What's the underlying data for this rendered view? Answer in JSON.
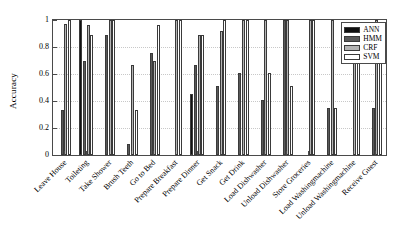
{
  "chart_data": {
    "type": "bar",
    "title": "",
    "xlabel": "",
    "ylabel": "Accuracy",
    "ylim": [
      0,
      1
    ],
    "yticks": [
      "0",
      "0.2",
      "0.4",
      "0.6",
      "0.8",
      "1"
    ],
    "ytick_values": [
      0,
      0.2,
      0.4,
      0.6,
      0.8,
      1
    ],
    "grid": true,
    "legend_position": "top-right",
    "categories": [
      "Leave House",
      "Toileting",
      "Take Shower",
      "Brush Teeth",
      "Go to Bed",
      "Prepare Breakfast",
      "Prepare Dinner",
      "Get Snack",
      "Get Drink",
      "Load Dishwasher",
      "Unload Dishwasher",
      "Store Groceries",
      "Load Washingmachine",
      "Unload Washingmachine",
      "Receive Guest"
    ],
    "series": [
      {
        "name": "ANN",
        "color": "#101010",
        "values": [
          0,
          1.0,
          0,
          0,
          0,
          0,
          0.45,
          0,
          0,
          0,
          0,
          0,
          0,
          0,
          0
        ]
      },
      {
        "name": "HMM",
        "color": "#595959",
        "values": [
          0.33,
          0.7,
          0.89,
          0.08,
          0.755,
          0,
          0.67,
          0.51,
          0.61,
          0.41,
          1.0,
          0,
          0.345,
          0,
          0.345
        ]
      },
      {
        "name": "CRF",
        "color": "#b4b4b4",
        "values": [
          0.97,
          0.96,
          1.0,
          0.67,
          0.7,
          1.0,
          0.89,
          0.92,
          1.0,
          1.0,
          1.0,
          1.0,
          1.0,
          0.68,
          1.0
        ]
      },
      {
        "name": "SVM",
        "color": "#ffffff",
        "values": [
          1.0,
          0.89,
          1.0,
          0.335,
          0.96,
          1.0,
          0.89,
          1.0,
          1.0,
          0.61,
          0.51,
          1.0,
          0.345,
          0.76,
          0.68
        ]
      }
    ]
  },
  "legend": {
    "entries": [
      {
        "label": "ANN",
        "key": "ann"
      },
      {
        "label": "HMM",
        "key": "hmm"
      },
      {
        "label": "CRF",
        "key": "crf"
      },
      {
        "label": "SVM",
        "key": "svm"
      }
    ]
  }
}
